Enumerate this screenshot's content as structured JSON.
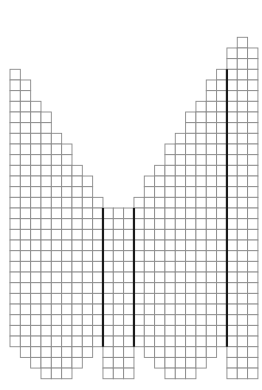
{
  "diagram": {
    "type": "knitting-chart-grid",
    "title": "",
    "total_columns": 24,
    "total_rows": 32,
    "grid_color": "#8a8a8a",
    "marker_line_color": "#1a1a1a",
    "columns": [
      {
        "col": 0,
        "first_row": 3,
        "last_row": 28
      },
      {
        "col": 1,
        "first_row": 4,
        "last_row": 29
      },
      {
        "col": 2,
        "first_row": 6,
        "last_row": 30
      },
      {
        "col": 3,
        "first_row": 7,
        "last_row": 31
      },
      {
        "col": 4,
        "first_row": 9,
        "last_row": 31
      },
      {
        "col": 5,
        "first_row": 10,
        "last_row": 31
      },
      {
        "col": 6,
        "first_row": 12,
        "last_row": 30
      },
      {
        "col": 7,
        "first_row": 13,
        "last_row": 29
      },
      {
        "col": 8,
        "first_row": 15,
        "last_row": 28
      },
      {
        "col": 9,
        "first_row": 16,
        "last_row": 31
      },
      {
        "col": 10,
        "first_row": 16,
        "last_row": 31
      },
      {
        "col": 11,
        "first_row": 16,
        "last_row": 31
      },
      {
        "col": 12,
        "first_row": 15,
        "last_row": 28
      },
      {
        "col": 13,
        "first_row": 13,
        "last_row": 29
      },
      {
        "col": 14,
        "first_row": 12,
        "last_row": 30
      },
      {
        "col": 15,
        "first_row": 10,
        "last_row": 31
      },
      {
        "col": 16,
        "first_row": 9,
        "last_row": 31
      },
      {
        "col": 17,
        "first_row": 7,
        "last_row": 31
      },
      {
        "col": 18,
        "first_row": 6,
        "last_row": 30
      },
      {
        "col": 19,
        "first_row": 4,
        "last_row": 29
      },
      {
        "col": 20,
        "first_row": 3,
        "last_row": 28
      },
      {
        "col": 21,
        "first_row": 1,
        "last_row": 31
      },
      {
        "col": 22,
        "first_row": 0,
        "last_row": 31
      },
      {
        "col": 23,
        "first_row": 1,
        "last_row": 31
      }
    ],
    "marker_lines": [
      {
        "name": "left-panel-divider",
        "before_col": 9,
        "first_row": 16,
        "last_row": 28
      },
      {
        "name": "center-panel-divider",
        "before_col": 12,
        "first_row": 16,
        "last_row": 28
      },
      {
        "name": "right-panel-divider",
        "before_col": 21,
        "first_row": 3,
        "last_row": 28
      }
    ]
  }
}
